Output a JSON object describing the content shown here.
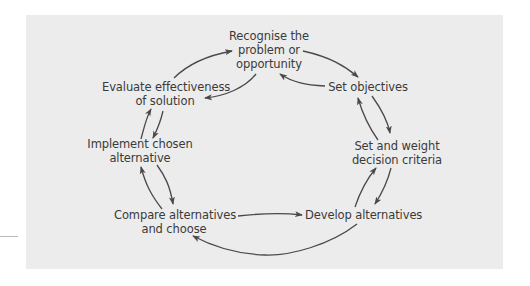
{
  "diagram": {
    "type": "cycle",
    "colors": {
      "panel": "#ececec",
      "text": "#3a3a3a",
      "arrow": "#4a4a4a"
    },
    "nodes": [
      {
        "id": "recognise",
        "line1": "Recognise the",
        "line2": "problem or",
        "line3": "opportunity"
      },
      {
        "id": "objectives",
        "line1": "Set objectives"
      },
      {
        "id": "criteria",
        "line1": "Set and weight",
        "line2": "decision criteria"
      },
      {
        "id": "develop",
        "line1": "Develop alternatives"
      },
      {
        "id": "compare",
        "line1": "Compare alternatives",
        "line2": "and choose"
      },
      {
        "id": "implement",
        "line1": "Implement chosen",
        "line2": "alternative"
      },
      {
        "id": "evaluate",
        "line1": "Evaluate effectiveness",
        "line2": "of solution"
      }
    ],
    "edges": [
      {
        "from": "recognise",
        "to": "objectives"
      },
      {
        "from": "objectives",
        "to": "recognise"
      },
      {
        "from": "objectives",
        "to": "criteria"
      },
      {
        "from": "criteria",
        "to": "objectives"
      },
      {
        "from": "criteria",
        "to": "develop"
      },
      {
        "from": "develop",
        "to": "criteria"
      },
      {
        "from": "compare",
        "to": "develop"
      },
      {
        "from": "develop",
        "to": "compare"
      },
      {
        "from": "compare",
        "to": "implement"
      },
      {
        "from": "implement",
        "to": "compare"
      },
      {
        "from": "implement",
        "to": "evaluate"
      },
      {
        "from": "evaluate",
        "to": "implement"
      },
      {
        "from": "evaluate",
        "to": "recognise"
      },
      {
        "from": "recognise",
        "to": "evaluate"
      }
    ]
  }
}
